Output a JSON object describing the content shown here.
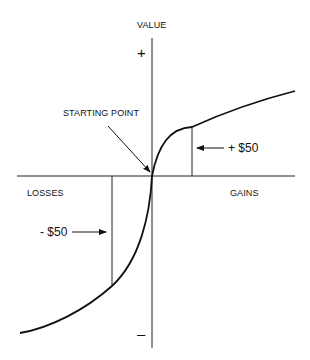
{
  "diagram": {
    "y_axis_label": "VALUE",
    "y_positive": "+",
    "y_negative": "–",
    "x_negative_label": "LOSSES",
    "x_positive_label": "GAINS",
    "origin_label": "STARTING POINT",
    "gain_marker": "+ $50",
    "loss_marker": "- $50",
    "colors": {
      "line": "#111111",
      "background": "#ffffff"
    }
  }
}
